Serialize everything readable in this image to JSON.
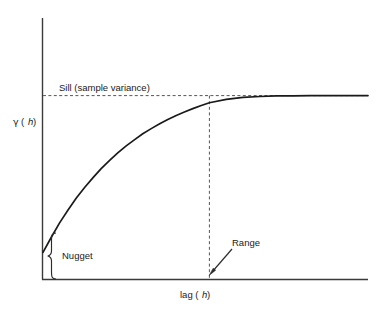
{
  "figure": {
    "background_color": "#ffffff",
    "line_color": "#1a1a1a",
    "axis_color": "#333333",
    "dash_color": "#4d4d4d"
  },
  "axes": {
    "x_label_prefix": "lag (",
    "x_label_var": "h",
    "x_label_suffix": ")",
    "y_label_symbol": "γ",
    "y_label_prefix": " (",
    "y_label_var": "h",
    "y_label_suffix": ")"
  },
  "annotations": {
    "sill": "Sill (sample variance)",
    "nugget": "Nugget",
    "range": "Range"
  },
  "chart_data": {
    "type": "line",
    "title": "",
    "xlabel": "lag (h)",
    "ylabel": "γ (h)",
    "xlim": [
      0,
      1
    ],
    "ylim": [
      0,
      1
    ],
    "grid": false,
    "legend": null,
    "model": "exponential semivariogram",
    "parameters": {
      "nugget": 0.145,
      "sill": 1.0,
      "partial_sill": 0.855,
      "range": 0.512
    },
    "annotations": [
      {
        "label": "Sill (sample variance)",
        "type": "horizontal-dashed-line",
        "y": 1.0
      },
      {
        "label": "Range",
        "type": "vertical-dashed-line",
        "x": 0.512
      },
      {
        "label": "Nugget",
        "type": "brace",
        "y_from": 0.0,
        "y_to": 0.145
      }
    ],
    "x": [
      0.0,
      0.026,
      0.051,
      0.077,
      0.102,
      0.128,
      0.154,
      0.179,
      0.205,
      0.23,
      0.256,
      0.282,
      0.307,
      0.333,
      0.359,
      0.384,
      0.41,
      0.435,
      0.461,
      0.487,
      0.512,
      0.564,
      0.615,
      0.667,
      0.718,
      0.769,
      0.821,
      0.872,
      0.923,
      0.975,
      1.0
    ],
    "y": [
      0.145,
      0.229,
      0.306,
      0.376,
      0.44,
      0.499,
      0.553,
      0.602,
      0.647,
      0.688,
      0.726,
      0.76,
      0.792,
      0.82,
      0.846,
      0.87,
      0.892,
      0.911,
      0.929,
      0.946,
      0.961,
      0.979,
      0.99,
      0.995,
      0.998,
      0.999,
      1.0,
      1.0,
      1.0,
      1.0,
      1.0
    ]
  }
}
